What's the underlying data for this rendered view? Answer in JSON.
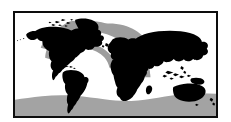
{
  "figure": {
    "type": "world-distribution-map",
    "title": "World distribution map",
    "caption": "",
    "frame": {
      "border_color": "#0d0d0d",
      "border_width_px": 2,
      "background_color": "#ffffff",
      "x": 13,
      "y": 11,
      "width": 205,
      "height": 107
    },
    "projection": "equirectangular",
    "lon_range": [
      -180,
      180
    ],
    "lat_range": [
      -75,
      84
    ]
  },
  "palette": {
    "land": "#000000",
    "ocean": "#ffffff",
    "range_shading": "#9d9d9d",
    "range_shading_south": "#a3a3a3",
    "frame": "#0d0d0d",
    "page_background": "#ffffff"
  },
  "legend": {
    "visible": false,
    "entries": [
      {
        "label": "Land",
        "color": "#000000"
      },
      {
        "label": "Distribution range",
        "color": "#9d9d9d"
      },
      {
        "label": "Ocean",
        "color": "#ffffff"
      }
    ]
  },
  "labels": {
    "visible": false,
    "items": []
  },
  "regions": {
    "land_masses": [
      "North America",
      "Greenland",
      "Arctic Archipelago",
      "South America",
      "Europe",
      "Africa",
      "Madagascar",
      "Asia",
      "Indonesia",
      "Japan",
      "Philippines",
      "New Guinea",
      "Australia",
      "New Zealand",
      "British Isles",
      "Iceland",
      "Caribbean Islands"
    ],
    "shaded_ranges": [
      {
        "name": "North Atlantic and Western Europe band",
        "description": "Diagonal gray band from the northwest Atlantic across to northern Europe and the Mediterranean"
      },
      {
        "name": "Southern Ocean band",
        "description": "Gray band spanning the southern latitudes across all oceans"
      }
    ]
  }
}
